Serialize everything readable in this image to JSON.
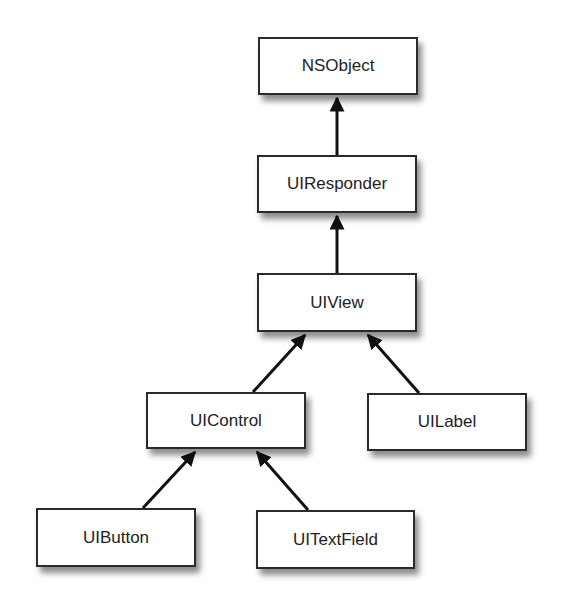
{
  "diagram": {
    "nodes": [
      {
        "id": "nsobject",
        "label": "NSObject",
        "x": 258,
        "y": 37,
        "w": 160,
        "h": 58
      },
      {
        "id": "uiresponder",
        "label": "UIResponder",
        "x": 257,
        "y": 155,
        "w": 160,
        "h": 58
      },
      {
        "id": "uiview",
        "label": "UIView",
        "x": 257,
        "y": 273,
        "w": 160,
        "h": 59
      },
      {
        "id": "uicontrol",
        "label": "UIControl",
        "x": 146,
        "y": 392,
        "w": 160,
        "h": 57
      },
      {
        "id": "uilabel",
        "label": "UILabel",
        "x": 367,
        "y": 393,
        "w": 160,
        "h": 58
      },
      {
        "id": "uibutton",
        "label": "UIButton",
        "x": 36,
        "y": 508,
        "w": 160,
        "h": 59
      },
      {
        "id": "uitextfield",
        "label": "UITextField",
        "x": 256,
        "y": 510,
        "w": 159,
        "h": 59
      }
    ],
    "edges": [
      {
        "from": "uiresponder",
        "to": "nsobject"
      },
      {
        "from": "uiview",
        "to": "uiresponder"
      },
      {
        "from": "uicontrol",
        "to": "uiview"
      },
      {
        "from": "uilabel",
        "to": "uiview"
      },
      {
        "from": "uibutton",
        "to": "uicontrol"
      },
      {
        "from": "uitextfield",
        "to": "uicontrol"
      }
    ],
    "colors": {
      "line": "#111111",
      "border": "#2a2a2a",
      "fill": "#ffffff"
    }
  }
}
